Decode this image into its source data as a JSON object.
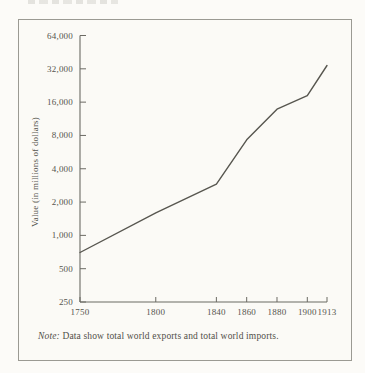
{
  "figure": {
    "note_label": "Note:",
    "note_text": "Data show total world exports and total world imports."
  },
  "colors": {
    "paper": "#fbfaf6",
    "ink": "#56554e",
    "series_line": "#57564f",
    "axis": "#6b6a63",
    "frame": "#9b9a93"
  },
  "chart_data": {
    "type": "line",
    "title": "",
    "xlabel": "",
    "ylabel": "Value (in millions of dollars)",
    "y_scale": "log2",
    "grid": false,
    "legend": false,
    "x_range": [
      1750,
      1913
    ],
    "y_range": [
      250,
      64000
    ],
    "x_ticks": [
      1750,
      1800,
      1840,
      1860,
      1880,
      1900,
      1913
    ],
    "x_tick_labels": [
      "1750",
      "1800",
      "1840",
      "1860",
      "1880",
      "1900",
      "1913"
    ],
    "y_ticks": [
      250,
      500,
      1000,
      2000,
      4000,
      8000,
      16000,
      32000,
      64000
    ],
    "y_tick_labels": [
      "250",
      "500",
      "1,000",
      "2,000",
      "4,000",
      "8,000",
      "16,000",
      "32,000",
      "64,000"
    ],
    "series": [
      {
        "name": "Total world exports and imports",
        "x": [
          1750,
          1800,
          1840,
          1860,
          1880,
          1900,
          1913
        ],
        "values": [
          700,
          1600,
          2900,
          7300,
          13800,
          18300,
          34300
        ]
      }
    ],
    "note": "Data show total world exports and total world imports."
  }
}
